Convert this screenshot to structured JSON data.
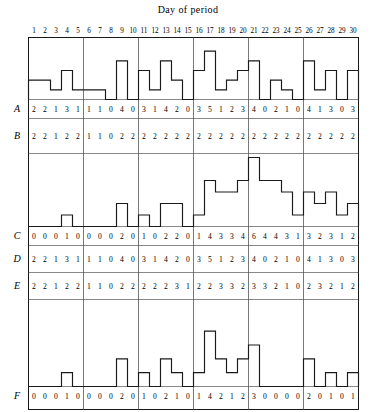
{
  "figure": {
    "title": "Day of period",
    "x_axis_label": "Day of period",
    "days": [
      1,
      2,
      3,
      4,
      5,
      6,
      7,
      8,
      9,
      10,
      11,
      12,
      13,
      14,
      15,
      16,
      17,
      18,
      19,
      20,
      21,
      22,
      23,
      24,
      25,
      26,
      27,
      28,
      29,
      30
    ],
    "group_size": 5,
    "group_count": 6,
    "row_labels": [
      "A",
      "B",
      "C",
      "D",
      "E",
      "F"
    ]
  },
  "chart_data": [
    {
      "type": "bar",
      "title": "Day of period",
      "xlabel": "Day of period",
      "ylabel": "",
      "series_label": "A",
      "categories": [
        1,
        2,
        3,
        4,
        5,
        6,
        7,
        8,
        9,
        10,
        11,
        12,
        13,
        14,
        15,
        16,
        17,
        18,
        19,
        20,
        21,
        22,
        23,
        24,
        25,
        26,
        27,
        28,
        29,
        30
      ],
      "values": [
        2,
        2,
        1,
        3,
        1,
        1,
        1,
        0,
        4,
        0,
        3,
        1,
        4,
        2,
        0,
        3,
        5,
        1,
        2,
        3,
        4,
        0,
        2,
        1,
        0,
        4,
        1,
        3,
        0,
        3
      ],
      "ylim": [
        0,
        6
      ],
      "grid": false,
      "legend": "none"
    },
    {
      "type": "bar",
      "title": "",
      "xlabel": "Day of period",
      "ylabel": "",
      "series_label": "C",
      "categories": [
        1,
        2,
        3,
        4,
        5,
        6,
        7,
        8,
        9,
        10,
        11,
        12,
        13,
        14,
        15,
        16,
        17,
        18,
        19,
        20,
        21,
        22,
        23,
        24,
        25,
        26,
        27,
        28,
        29,
        30
      ],
      "values": [
        0,
        0,
        0,
        1,
        0,
        0,
        0,
        0,
        2,
        0,
        1,
        0,
        2,
        2,
        0,
        1,
        4,
        3,
        3,
        4,
        6,
        4,
        4,
        3,
        1,
        3,
        2,
        3,
        1,
        2
      ],
      "ylim": [
        0,
        6
      ],
      "grid": false,
      "legend": "none"
    },
    {
      "type": "bar",
      "title": "",
      "xlabel": "Day of period",
      "ylabel": "",
      "series_label": "F",
      "categories": [
        1,
        2,
        3,
        4,
        5,
        6,
        7,
        8,
        9,
        10,
        11,
        12,
        13,
        14,
        15,
        16,
        17,
        18,
        19,
        20,
        21,
        22,
        23,
        24,
        25,
        26,
        27,
        28,
        29,
        30
      ],
      "values": [
        0,
        0,
        0,
        1,
        0,
        0,
        0,
        0,
        2,
        0,
        1,
        0,
        2,
        1,
        0,
        1,
        4,
        2,
        1,
        2,
        3,
        0,
        0,
        0,
        0,
        2,
        0,
        1,
        0,
        1
      ],
      "ylim": [
        0,
        6
      ],
      "grid": false,
      "legend": "none"
    }
  ],
  "table": {
    "rows": [
      {
        "label": "A",
        "values": [
          2,
          2,
          1,
          3,
          1,
          1,
          1,
          0,
          4,
          0,
          3,
          1,
          4,
          2,
          0,
          3,
          5,
          1,
          2,
          3,
          4,
          0,
          2,
          1,
          0,
          4,
          1,
          3,
          0,
          3
        ]
      },
      {
        "label": "B",
        "values": [
          2,
          2,
          1,
          2,
          2,
          1,
          1,
          0,
          2,
          2,
          2,
          2,
          2,
          2,
          2,
          2,
          2,
          2,
          2,
          2,
          2,
          2,
          2,
          2,
          2,
          2,
          2,
          2,
          2,
          2
        ]
      },
      {
        "label": "C",
        "values": [
          0,
          0,
          0,
          1,
          0,
          0,
          0,
          0,
          2,
          0,
          1,
          0,
          2,
          2,
          0,
          1,
          4,
          3,
          3,
          4,
          6,
          4,
          4,
          3,
          1,
          3,
          2,
          3,
          1,
          2
        ]
      },
      {
        "label": "D",
        "values": [
          2,
          2,
          1,
          3,
          1,
          1,
          1,
          0,
          4,
          0,
          3,
          1,
          4,
          2,
          0,
          3,
          5,
          1,
          2,
          3,
          4,
          0,
          2,
          1,
          0,
          4,
          1,
          3,
          0,
          3
        ]
      },
      {
        "label": "E",
        "values": [
          2,
          2,
          1,
          2,
          2,
          1,
          1,
          0,
          2,
          2,
          2,
          2,
          2,
          3,
          1,
          2,
          2,
          3,
          3,
          2,
          3,
          3,
          2,
          1,
          0,
          2,
          3,
          2,
          1,
          2
        ]
      },
      {
        "label": "F",
        "values": [
          0,
          0,
          0,
          1,
          0,
          0,
          0,
          0,
          2,
          0,
          1,
          0,
          2,
          1,
          0,
          1,
          4,
          2,
          1,
          2,
          3,
          0,
          0,
          0,
          0,
          2,
          0,
          1,
          0,
          1
        ]
      }
    ]
  }
}
